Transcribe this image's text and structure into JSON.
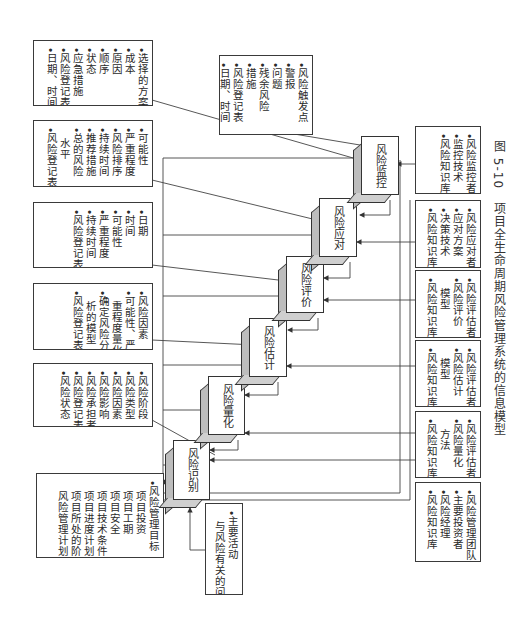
{
  "caption": "图 5-10　项目全生命周期风险管理系统的信息模型",
  "outputs": [
    {
      "id": "monitor-out",
      "lines": [
        "•选择的方案",
        "•成本",
        "•原因",
        "•顺序",
        "•状态",
        "•应急措施",
        "•风险登记表",
        "•日期、时间"
      ]
    },
    {
      "id": "response-out",
      "lines": [
        "•可能性",
        "•严重程度",
        "•风险排序",
        "•持续时间",
        "•推荐措施",
        "•总的风险",
        "　水平",
        "•风险登记表"
      ]
    },
    {
      "id": "evaluation-out",
      "lines": [
        "•日期",
        "•时间",
        "•可能性",
        "•严重程度",
        "•持续时间",
        "•风险登记表"
      ]
    },
    {
      "id": "estimation-out",
      "lines": [
        "•风险因素",
        "•可能性、严",
        "　重程度量化",
        "•确定风险分",
        "　析的模型",
        "•风险登记表"
      ]
    },
    {
      "id": "quantification-out",
      "lines": [
        "•风险阶段",
        "•风险类型",
        "•风险因素",
        "•风险影响",
        "•风险承担者",
        "•风险登记表",
        "•风险状态"
      ]
    },
    {
      "id": "identification-in",
      "lines": [
        "•风险管理目标",
        "　项目投资",
        "　项目工期",
        "　项目安全",
        "　项目技术条件",
        "　项目进度计划",
        "　项目所处的阶段",
        "　风险管理计划"
      ]
    }
  ],
  "trigger_box": {
    "lines": [
      "•风险触发点",
      "•警报",
      "•问题",
      "•残余风险",
      "•措施",
      "•风险登记表",
      "•日期、时间"
    ]
  },
  "activity_box": {
    "lines": [
      "•主要活动",
      "　与风险有关的问题"
    ]
  },
  "processes": [
    {
      "id": "identify",
      "label": "风险识别"
    },
    {
      "id": "quantify",
      "label": "风险量化"
    },
    {
      "id": "estimate",
      "label": "风险估计"
    },
    {
      "id": "evaluate",
      "label": "风险评价"
    },
    {
      "id": "respond",
      "label": "风险应对"
    },
    {
      "id": "monitor",
      "label": "风险监控"
    }
  ],
  "resources": [
    {
      "id": "monitor-res",
      "lines": [
        "•风险监控者",
        "•监控技术",
        "•风险知识库"
      ]
    },
    {
      "id": "respond-res",
      "lines": [
        "•风险应对者",
        "•应对方案",
        "•决策技术",
        "•风险知识库"
      ]
    },
    {
      "id": "evaluate-res",
      "lines": [
        "•风险评估者",
        "•风险评价",
        "　模型",
        "•风险知识库"
      ]
    },
    {
      "id": "estimate-res",
      "lines": [
        "•风险评估者",
        "•风险估计",
        "　模型",
        "•风险知识库"
      ]
    },
    {
      "id": "quantify-res",
      "lines": [
        "•风险评估者",
        "•风险量化",
        "　方法",
        "•风险知识库"
      ]
    },
    {
      "id": "team-res",
      "lines": [
        "•风险管理团队",
        "•主要投资者",
        "•风险经理",
        "•风险知识库"
      ]
    }
  ]
}
